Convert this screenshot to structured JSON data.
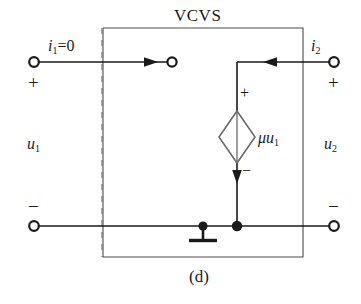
{
  "figure": {
    "title": "VCVS",
    "caption": "(d)",
    "background_color": "#ffffff",
    "line_color": "#1a1a1a",
    "diamond_color": "#6b6b6b"
  },
  "labels": {
    "input_current": "i1=0",
    "input_current_sym": "i",
    "input_current_sub": "1",
    "input_current_eq": "=0",
    "output_current_sym": "i",
    "output_current_sub": "2",
    "input_voltage_sym": "u",
    "input_voltage_sub": "1",
    "output_voltage_sym": "u",
    "output_voltage_sub": "2",
    "source_sym": "μu",
    "source_sub": "1",
    "plus": "+",
    "minus": "−"
  },
  "terminals": [
    {
      "name": "input-plus-terminal",
      "x": 34,
      "y": 62,
      "sign": "+"
    },
    {
      "name": "input-minus-terminal",
      "x": 34,
      "y": 226,
      "sign": "−"
    },
    {
      "name": "output-plus-terminal",
      "x": 334,
      "y": 62,
      "sign": "+"
    },
    {
      "name": "output-minus-terminal",
      "x": 334,
      "y": 226,
      "sign": "−"
    },
    {
      "name": "open-circuit-terminal",
      "x": 172,
      "y": 62,
      "sign": ""
    }
  ],
  "components": {
    "dependent_source": {
      "type": "diamond",
      "kind": "voltage-controlled-voltage-source",
      "center_x": 237,
      "center_y": 137,
      "half_width": 18,
      "half_height": 26,
      "polarity_plus": "+",
      "polarity_minus": "−"
    },
    "ground": {
      "x": 203,
      "y": 226,
      "bar_width": 28
    },
    "box": {
      "left": 103,
      "top": 28,
      "right": 303,
      "bottom": 257
    },
    "dashed_divider": {
      "x": 102,
      "top": 28,
      "bottom": 257
    }
  }
}
